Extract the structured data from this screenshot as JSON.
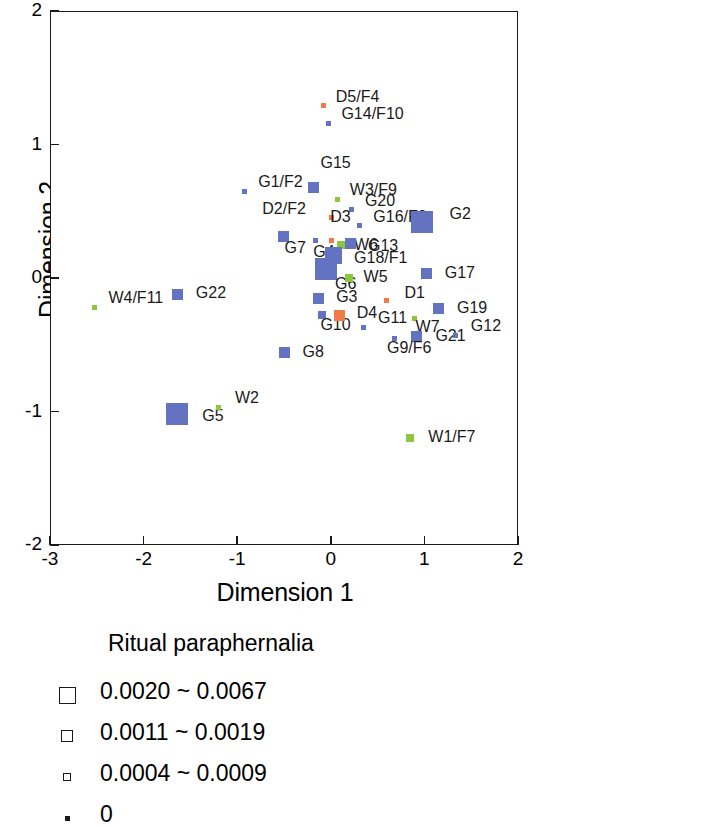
{
  "chart_data": {
    "type": "scatter",
    "title": "",
    "xlabel": "Dimension 1",
    "ylabel": "Dimension 2",
    "xlim": [
      -3,
      2
    ],
    "ylim": [
      -2,
      2
    ],
    "xticks": [
      -3,
      -2,
      -1,
      0,
      1,
      2
    ],
    "xtick_labels": [
      "-3",
      "-2",
      "-1",
      "0",
      "1",
      "2"
    ],
    "yticks": [
      -2,
      -1,
      0,
      1,
      2
    ],
    "ytick_labels": [
      "-2",
      "-1",
      "0",
      "1",
      "2"
    ],
    "grid": false,
    "legend_position": "below-plot",
    "colors": {
      "blue": "#6472c2",
      "green": "#8cc63f",
      "orange": "#f07b46",
      "axis": "#1a1a1a",
      "background": "#ffffff"
    },
    "size_classes": {
      "xlarge": 22,
      "large": 17,
      "medium": 11,
      "small": 8,
      "tiny": 5
    },
    "points": [
      {
        "label": "D5/F4",
        "x": -0.08,
        "y": 1.29,
        "color": "orange",
        "size": "tiny",
        "lx": 10,
        "ly": -9
      },
      {
        "label": "G14/F10",
        "x": -0.02,
        "y": 1.16,
        "color": "blue",
        "size": "tiny",
        "lx": 10,
        "ly": -9
      },
      {
        "label": "G15",
        "x": -0.19,
        "y": 0.68,
        "color": "blue",
        "size": "medium",
        "lx": 2,
        "ly": -24
      },
      {
        "label": "G1/F2",
        "x": -0.92,
        "y": 0.65,
        "color": "blue",
        "size": "tiny",
        "lx": 11,
        "ly": -9
      },
      {
        "label": "W3/F9",
        "x": 0.07,
        "y": 0.59,
        "color": "green",
        "size": "tiny",
        "lx": 10,
        "ly": -9
      },
      {
        "label": "D2/F2",
        "x": 0.01,
        "y": 0.45,
        "color": "orange",
        "size": "tiny",
        "lx": -72,
        "ly": -9
      },
      {
        "label": "G20",
        "x": 0.22,
        "y": 0.51,
        "color": "blue",
        "size": "tiny",
        "lx": 11,
        "ly": -9
      },
      {
        "label": "G16/F3",
        "x": 0.31,
        "y": 0.39,
        "color": "blue",
        "size": "tiny",
        "lx": 11,
        "ly": -9
      },
      {
        "label": "G2",
        "x": 0.97,
        "y": 0.42,
        "color": "blue",
        "size": "xlarge",
        "lx": 17,
        "ly": -8
      },
      {
        "label": "D3",
        "x": 0.01,
        "y": 0.28,
        "color": "orange",
        "size": "tiny",
        "lx": -4,
        "ly": -24
      },
      {
        "label": "G7",
        "x": -0.51,
        "y": 0.31,
        "color": "blue",
        "size": "medium",
        "lx": -4,
        "ly": 11
      },
      {
        "label": "G4",
        "x": -0.16,
        "y": 0.28,
        "color": "blue",
        "size": "tiny",
        "lx": -5,
        "ly": 11
      },
      {
        "label": "W6",
        "x": 0.11,
        "y": 0.25,
        "color": "green",
        "size": "small",
        "lx": 9,
        "ly": 0
      },
      {
        "label": "G13",
        "x": 0.21,
        "y": 0.26,
        "color": "blue",
        "size": "medium",
        "lx": 12,
        "ly": 3
      },
      {
        "label": "G18/F1",
        "x": 0.03,
        "y": 0.17,
        "color": "blue",
        "size": "large",
        "lx": 12,
        "ly": 3
      },
      {
        "label": "G6",
        "x": -0.05,
        "y": 0.07,
        "color": "blue",
        "size": "xlarge",
        "lx": -2,
        "ly": 15
      },
      {
        "label": "W5",
        "x": 0.19,
        "y": 0.0,
        "color": "green",
        "size": "small",
        "lx": 11,
        "ly": -1
      },
      {
        "label": "G17",
        "x": 1.02,
        "y": 0.03,
        "color": "blue",
        "size": "medium",
        "lx": 13,
        "ly": -1
      },
      {
        "label": "G22",
        "x": -1.64,
        "y": -0.12,
        "color": "blue",
        "size": "medium",
        "lx": 13,
        "ly": -1
      },
      {
        "label": "W4/F11",
        "x": -2.52,
        "y": -0.22,
        "color": "green",
        "size": "tiny",
        "lx": 11,
        "ly": -9
      },
      {
        "label": "G3",
        "x": -0.13,
        "y": -0.15,
        "color": "blue",
        "size": "medium",
        "lx": 12,
        "ly": -1
      },
      {
        "label": "D1",
        "x": 0.6,
        "y": -0.17,
        "color": "orange",
        "size": "tiny",
        "lx": 15,
        "ly": -8
      },
      {
        "label": "G19",
        "x": 1.15,
        "y": -0.23,
        "color": "blue",
        "size": "medium",
        "lx": 13,
        "ly": -1
      },
      {
        "label": "G10",
        "x": -0.09,
        "y": -0.28,
        "color": "blue",
        "size": "small",
        "lx": -6,
        "ly": 10
      },
      {
        "label": "D4",
        "x": 0.09,
        "y": -0.28,
        "color": "orange",
        "size": "medium",
        "lx": 12,
        "ly": -2
      },
      {
        "label": "W7",
        "x": 0.89,
        "y": -0.3,
        "color": "green",
        "size": "tiny",
        "lx": -1,
        "ly": 9
      },
      {
        "label": "G11",
        "x": 0.35,
        "y": -0.37,
        "color": "blue",
        "size": "tiny",
        "lx": 12,
        "ly": -9
      },
      {
        "label": "G21",
        "x": 0.92,
        "y": -0.44,
        "color": "blue",
        "size": "medium",
        "lx": 13,
        "ly": -1
      },
      {
        "label": "G12",
        "x": 1.33,
        "y": -0.43,
        "color": "blue",
        "size": "tiny",
        "lx": 13,
        "ly": -9
      },
      {
        "label": "G9/F6",
        "x": 0.68,
        "y": -0.45,
        "color": "blue",
        "size": "tiny",
        "lx": -10,
        "ly": 10
      },
      {
        "label": "G8",
        "x": -0.5,
        "y": -0.56,
        "color": "blue",
        "size": "medium",
        "lx": 13,
        "ly": -1
      },
      {
        "label": "G5",
        "x": -1.64,
        "y": -1.02,
        "color": "blue",
        "size": "xlarge",
        "lx": 14,
        "ly": 2
      },
      {
        "label": "W2",
        "x": -1.2,
        "y": -0.97,
        "color": "green",
        "size": "tiny",
        "lx": 14,
        "ly": -9
      },
      {
        "label": "W1/F7",
        "x": 0.85,
        "y": -1.2,
        "color": "green",
        "size": "small",
        "lx": 14,
        "ly": -1
      }
    ]
  },
  "legend": {
    "title": "Ritual paraphernalia",
    "entries": [
      {
        "label": "0.0020 ~ 0.0067",
        "swatch_px": 17
      },
      {
        "label": "0.0011 ~ 0.0019",
        "swatch_px": 12
      },
      {
        "label": "0.0004 ~ 0.0009",
        "swatch_px": 8
      },
      {
        "label": "0",
        "swatch_px": 5
      }
    ]
  }
}
